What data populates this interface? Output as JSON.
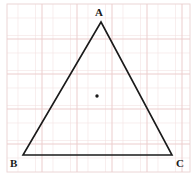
{
  "figure": {
    "kind": "geometry-diagram",
    "background_color": "#ffffff",
    "grid": {
      "visible": true,
      "line_color": "#f0dede",
      "major_line_color": "#eccccc",
      "cell_size_px": 17.5,
      "origin_x_px": 7,
      "origin_y_px": 4,
      "region_width_px": 183,
      "region_height_px": 168,
      "border_color": "#e8d2d2"
    },
    "triangle": {
      "stroke_color": "#1a1a1a",
      "stroke_width_px": 1.6,
      "fill": "none",
      "vertices": [
        {
          "label": "A",
          "x": 101,
          "y": 22,
          "label_x": 95,
          "label_y": 7
        },
        {
          "label": "B",
          "x": 23,
          "y": 155,
          "label_x": 10,
          "label_y": 158
        },
        {
          "label": "C",
          "x": 172,
          "y": 155,
          "label_x": 176,
          "label_y": 158
        }
      ]
    },
    "marked_point": {
      "name": "centroid-point",
      "x": 97,
      "y": 96,
      "radius_px": 1.7,
      "color": "#1a1a1a"
    },
    "labels": {
      "a": "A",
      "b": "B",
      "c": "C"
    }
  }
}
